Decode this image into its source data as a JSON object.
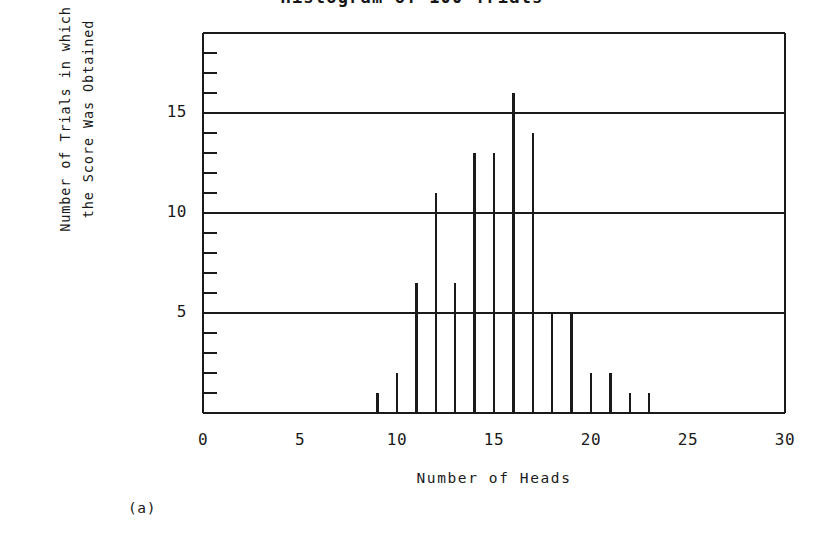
{
  "figure": {
    "panel_tag": "(a)",
    "title_remnant": "Histogram of 100 Trials"
  },
  "chart_data": {
    "type": "bar",
    "title": "",
    "xlabel": "Number of Heads",
    "ylabel_line1": "Number of Trials in which",
    "ylabel_line2": "the Score Was Obtained",
    "xlim": [
      0,
      30
    ],
    "ylim": [
      0,
      19
    ],
    "xticks": [
      0,
      5,
      10,
      15,
      20,
      25,
      30
    ],
    "xtick_labels": [
      "0",
      "5",
      "10",
      "15",
      "20",
      "25",
      "30"
    ],
    "yticks": [
      5,
      10,
      15
    ],
    "ytick_labels": [
      "5",
      "10",
      "15"
    ],
    "y_minor_tick_step": 1,
    "x_minor_tick_range": [
      9,
      23
    ],
    "grid": "horizontal-major-only",
    "legend": "none",
    "style": "impulse/spike histogram, scanned line art, black on white",
    "categories": [
      9,
      10,
      11,
      12,
      13,
      14,
      15,
      16,
      17,
      18,
      19,
      20,
      21,
      22,
      23
    ],
    "values": [
      1,
      2,
      6.5,
      11,
      6.5,
      13,
      13,
      16,
      14,
      5,
      5,
      2,
      2,
      1,
      1
    ],
    "series": [
      {
        "name": "Trials obtaining score",
        "points": [
          {
            "x": 9,
            "y": 1
          },
          {
            "x": 10,
            "y": 2
          },
          {
            "x": 11,
            "y": 6.5
          },
          {
            "x": 12,
            "y": 11
          },
          {
            "x": 13,
            "y": 6.5
          },
          {
            "x": 14,
            "y": 13
          },
          {
            "x": 15,
            "y": 13
          },
          {
            "x": 16,
            "y": 16
          },
          {
            "x": 17,
            "y": 14
          },
          {
            "x": 18,
            "y": 5
          },
          {
            "x": 19,
            "y": 5
          },
          {
            "x": 20,
            "y": 2
          },
          {
            "x": 21,
            "y": 2
          },
          {
            "x": 22,
            "y": 1
          },
          {
            "x": 23,
            "y": 1
          }
        ]
      }
    ]
  },
  "colors": {
    "ink": "#1a1a1a",
    "background": "#ffffff"
  }
}
